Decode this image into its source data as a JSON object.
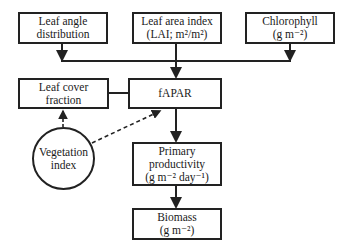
{
  "nodes": {
    "leaf_angle": {
      "lines": [
        "Leaf angle",
        "distribution"
      ]
    },
    "lai": {
      "lines": [
        "Leaf area index",
        "(LAI; m²/m²)"
      ]
    },
    "chlorophyll": {
      "lines": [
        "Chlorophyll",
        "(g m⁻²)"
      ]
    },
    "leaf_cover": {
      "lines": [
        "Leaf cover",
        "fraction"
      ]
    },
    "fapar": {
      "lines": [
        "fAPAR"
      ]
    },
    "vegetation_index": {
      "lines": [
        "Vegetation",
        "index"
      ]
    },
    "primary_productivity": {
      "lines": [
        "Primary",
        "productivity",
        "(g m⁻² day⁻¹)"
      ]
    },
    "biomass": {
      "lines": [
        "Biomass",
        "(g m⁻²)"
      ]
    }
  },
  "edges": [
    {
      "from": "leaf_angle",
      "to": "fapar",
      "style": "solid"
    },
    {
      "from": "lai",
      "to": "fapar",
      "style": "solid"
    },
    {
      "from": "chlorophyll",
      "to": "fapar",
      "style": "solid"
    },
    {
      "from": "leaf_cover",
      "to": "fapar",
      "style": "solid-undirected"
    },
    {
      "from": "vegetation_index",
      "to": "leaf_cover",
      "style": "dashed"
    },
    {
      "from": "vegetation_index",
      "to": "fapar",
      "style": "dashed"
    },
    {
      "from": "fapar",
      "to": "primary_productivity",
      "style": "solid"
    },
    {
      "from": "primary_productivity",
      "to": "biomass",
      "style": "solid"
    }
  ],
  "colors": {
    "stroke": "#222222",
    "background": "#ffffff"
  }
}
